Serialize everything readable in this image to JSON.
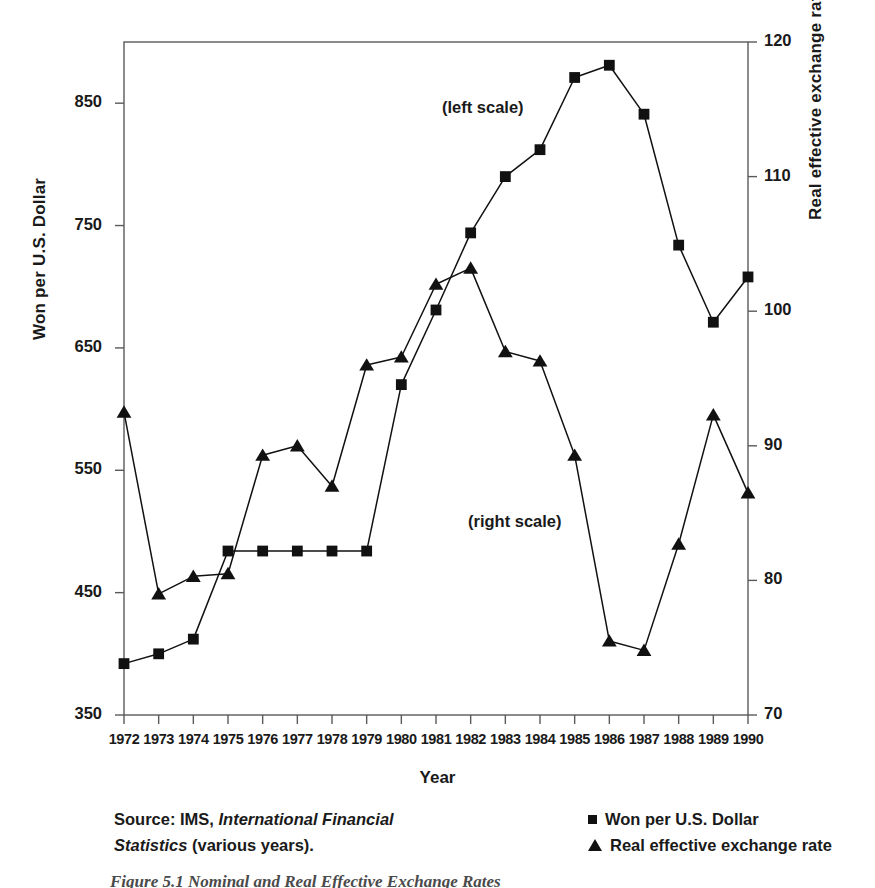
{
  "axis_titles": {
    "left": "Won per U.S. Dollar",
    "right": "Real effective exchange rate (1980–82 = 100)",
    "x": "Year"
  },
  "annotations": {
    "left_scale": "(left scale)",
    "right_scale": "(right scale)"
  },
  "source": {
    "line1_prefix": "Source: IMS, ",
    "line1_italic": "International Financial",
    "line2_italic": "Statistics",
    "line2_suffix": " (various years)."
  },
  "legend": {
    "items": [
      {
        "label": "Won per U.S. Dollar",
        "marker": "square-marker"
      },
      {
        "label": "Real effective exchange rate",
        "marker": "triangle-marker"
      }
    ]
  },
  "caption": "Figure 5.1  Nominal and Real Effective Exchange Rates",
  "chart_data": {
    "type": "line",
    "title": "",
    "xlabel": "Year",
    "grid": false,
    "legend_position": "bottom-right",
    "x": [
      1972,
      1973,
      1974,
      1975,
      1976,
      1977,
      1978,
      1979,
      1980,
      1981,
      1982,
      1983,
      1984,
      1985,
      1986,
      1987,
      1988,
      1989,
      1990
    ],
    "xtick_labels": [
      "1972",
      "1973",
      "1974",
      "1975",
      "1976",
      "1977",
      "1978",
      "1979",
      "1980",
      "1981",
      "1982",
      "1983",
      "1984",
      "1985",
      "1986",
      "1987",
      "1988",
      "1989",
      "1990"
    ],
    "axes": {
      "left": {
        "label": "Won per U.S. Dollar",
        "ylim": [
          350,
          900
        ],
        "ticks": [
          350,
          450,
          550,
          650,
          750,
          850
        ],
        "tick_labels": [
          "350",
          "450",
          "550",
          "650",
          "750",
          "850"
        ]
      },
      "right": {
        "label": "Real effective exchange rate (1980–82 = 100)",
        "ylim": [
          70,
          120
        ],
        "ticks": [
          70,
          80,
          90,
          100,
          110,
          120
        ],
        "tick_labels": [
          "70",
          "80",
          "90",
          "100",
          "110",
          "120"
        ]
      }
    },
    "series": [
      {
        "name": "Won per U.S. Dollar",
        "axis": "left",
        "marker": "square",
        "color": "#111111",
        "values": [
          392,
          400,
          412,
          484,
          484,
          484,
          484,
          484,
          620,
          681,
          744,
          790,
          812,
          871,
          881,
          841,
          734,
          671,
          708
        ]
      },
      {
        "name": "Real effective exchange rate",
        "axis": "right",
        "marker": "triangle",
        "color": "#111111",
        "values": [
          92.5,
          79.0,
          80.3,
          80.5,
          89.3,
          90.0,
          87.0,
          96.0,
          96.6,
          102.0,
          103.2,
          97.0,
          96.3,
          89.3,
          75.5,
          74.8,
          82.7,
          92.3,
          86.5
        ]
      }
    ]
  },
  "colors": {
    "ink": "#111111",
    "axis": "#5a5a5a",
    "caption": "#4a4a4a"
  }
}
